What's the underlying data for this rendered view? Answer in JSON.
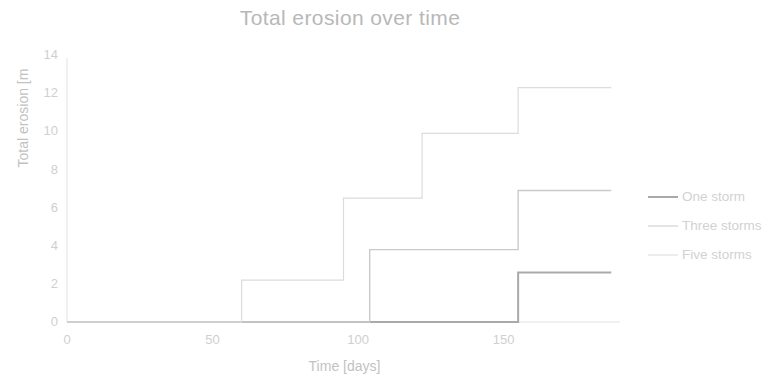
{
  "chart_data": {
    "type": "line",
    "step": "post",
    "title": "Total erosion over time",
    "xlabel": "Time [days]",
    "ylabel": "Total erosion [m",
    "xlim": [
      0,
      190
    ],
    "ylim": [
      0,
      14.8
    ],
    "xticks": [
      0,
      50,
      100,
      150
    ],
    "yticks": [
      0,
      2,
      4,
      6,
      8,
      10,
      12,
      14
    ],
    "grid": false,
    "legend_position": "right",
    "series": [
      {
        "name": "One storm",
        "color": "#a9a9a9",
        "width": 2.0,
        "x": [
          0,
          155,
          155,
          187
        ],
        "y": [
          0,
          0,
          2.6,
          2.6
        ]
      },
      {
        "name": "Three storms",
        "color": "#cacaca",
        "width": 1.4,
        "x": [
          0,
          104,
          104,
          155,
          155,
          187
        ],
        "y": [
          0,
          0,
          3.8,
          3.8,
          6.9,
          6.9
        ]
      },
      {
        "name": "Five storms",
        "color": "#dcdcdc",
        "width": 1.2,
        "x": [
          0,
          60,
          60,
          95,
          95,
          122,
          122,
          155,
          155,
          187
        ],
        "y": [
          0,
          0,
          2.2,
          2.2,
          6.5,
          6.5,
          9.9,
          9.9,
          12.3,
          12.3
        ]
      }
    ]
  },
  "legend": {
    "entries": [
      {
        "label": "One storm",
        "color": "#a9a9a9"
      },
      {
        "label": "Three storms",
        "color": "#cacaca"
      },
      {
        "label": "Five storms",
        "color": "#dcdcdc"
      }
    ]
  },
  "axis": {
    "axis_color": "#e2e2e2",
    "tick_color": "#cfcfcf",
    "title_color": "#b8b8b8"
  }
}
